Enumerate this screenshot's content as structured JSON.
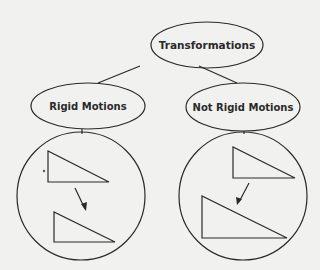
{
  "diagram": {
    "root": {
      "label": "Transformations"
    },
    "children": [
      {
        "label": "Rigid Motions",
        "example": "congruent triangle moved (translation)"
      },
      {
        "label": "Not Rigid Motions",
        "example": "triangle enlarged (dilation)"
      }
    ]
  },
  "colors": {
    "background": "#f1f1ef",
    "stroke": "#2a2a2a"
  }
}
